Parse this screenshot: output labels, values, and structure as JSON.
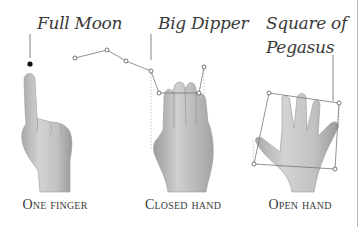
{
  "figure": {
    "panels": [
      {
        "id": "one-finger",
        "object_label": "Full Moon",
        "gesture_caption": "One finger"
      },
      {
        "id": "closed-hand",
        "object_label": "Big Dipper",
        "gesture_caption": "Closed hand"
      },
      {
        "id": "open-hand",
        "object_label_line1": "Square of",
        "object_label_line2": "Pegasus",
        "gesture_caption": "Open hand"
      }
    ],
    "colors": {
      "ink": "#3a3a3a",
      "skin_light": "#d4d4d4",
      "skin_mid": "#b5b5b5",
      "skin_dark": "#8a8a8a",
      "line": "#777777"
    }
  }
}
